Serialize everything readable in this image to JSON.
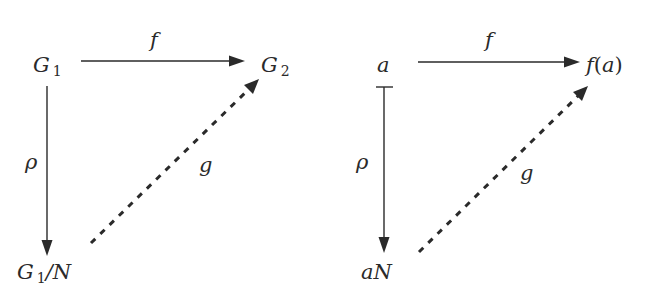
{
  "diagrams": [
    {
      "id": "homomorphism-diagram",
      "nodes": {
        "top_left": {
          "base": "G",
          "sub": "1",
          "suffix": ""
        },
        "top_right": {
          "base": "G",
          "sub": "2",
          "suffix": ""
        },
        "bottom_left": {
          "base": "G",
          "sub": "1",
          "suffix": "/N"
        }
      },
      "arrows": {
        "top": {
          "label": "f",
          "style": "solid",
          "head": "arrow"
        },
        "left": {
          "label": "ρ",
          "style": "solid",
          "head": "arrow"
        },
        "diagonal": {
          "label": "g",
          "style": "dashed",
          "head": "arrow"
        }
      }
    },
    {
      "id": "element-diagram",
      "nodes": {
        "top_left": {
          "text": "a"
        },
        "top_right": {
          "text_f": "f",
          "text_paren_open": "(",
          "text_arg": "a",
          "text_paren_close": ")"
        },
        "bottom_left": {
          "text": "aN"
        }
      },
      "arrows": {
        "top": {
          "label": "f",
          "style": "solid",
          "head": "arrow"
        },
        "left": {
          "label": "ρ",
          "style": "solid",
          "head": "maps-to-arrow"
        },
        "diagonal": {
          "label": "g",
          "style": "dashed",
          "head": "arrow"
        }
      }
    }
  ],
  "colors": {
    "ink": "#2a2a2a",
    "background": "#ffffff"
  }
}
